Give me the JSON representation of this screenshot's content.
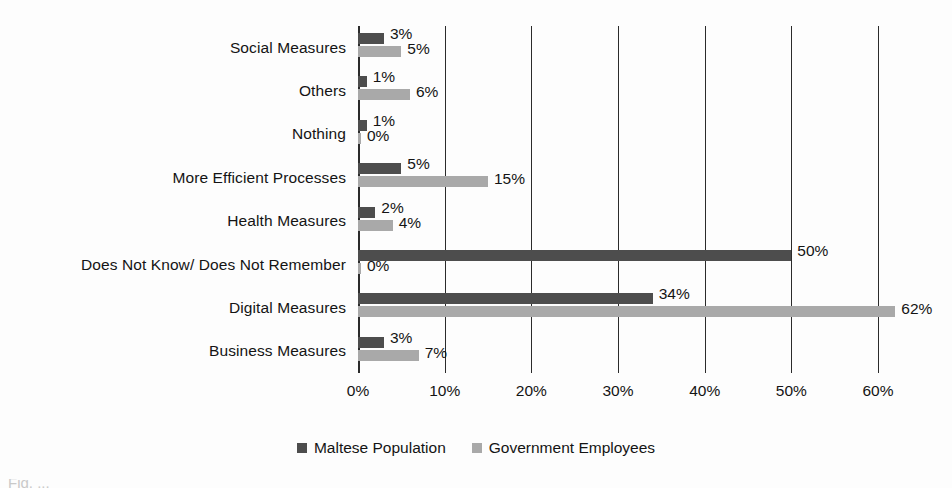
{
  "chart_data": {
    "type": "bar",
    "orientation": "horizontal",
    "title": "",
    "xlabel": "",
    "ylabel": "",
    "xlim": [
      0,
      65
    ],
    "grid": true,
    "legend_position": "bottom-center",
    "tick_labels": [
      "0%",
      "10%",
      "20%",
      "30%",
      "40%",
      "50%",
      "60%"
    ],
    "tick_values": [
      0,
      10,
      20,
      30,
      40,
      50,
      60
    ],
    "categories": [
      "Social Measures",
      "Others",
      "Nothing",
      "More Efficient Processes",
      "Health Measures",
      "Does Not Know/ Does Not Remember",
      "Digital Measures",
      "Business Measures"
    ],
    "series": [
      {
        "name": "Maltese Population",
        "color": "#4d4d4d",
        "values": [
          3,
          1,
          1,
          5,
          2,
          50,
          34,
          3
        ],
        "labels": [
          "3%",
          "1%",
          "1%",
          "5%",
          "2%",
          "50%",
          "34%",
          "3%"
        ]
      },
      {
        "name": "Government Employees",
        "color": "#a9a9a9",
        "values": [
          5,
          6,
          0,
          15,
          4,
          0,
          62,
          7
        ],
        "labels": [
          "5%",
          "6%",
          "0%",
          "15%",
          "4%",
          "0%",
          "62%",
          "7%"
        ]
      }
    ]
  },
  "caption": {
    "partial_text": "Fig. ..."
  }
}
